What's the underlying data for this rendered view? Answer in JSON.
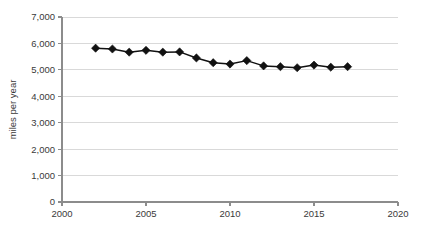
{
  "chart_data": {
    "type": "line",
    "title": "",
    "subtitle": "",
    "xlabel": "",
    "ylabel": "miles per year",
    "xlim": [
      2000,
      2020
    ],
    "ylim": [
      0,
      7000
    ],
    "grid": true,
    "legend": "none",
    "marker": "diamond",
    "marker_color": "#111111",
    "line_color": "#111111",
    "grid_color": "#d9d9d9",
    "axis_color": "#8c8c8c",
    "x_tick_labels": [
      "2000",
      "2005",
      "2010",
      "2015",
      "2020"
    ],
    "x_ticks": [
      2000,
      2005,
      2010,
      2015,
      2020
    ],
    "y_tick_labels": [
      "0",
      "1,000",
      "2,000",
      "3,000",
      "4,000",
      "5,000",
      "6,000",
      "7,000"
    ],
    "y_ticks": [
      0,
      1000,
      2000,
      3000,
      4000,
      5000,
      6000,
      7000
    ],
    "x": [
      2002,
      2003,
      2004,
      2005,
      2006,
      2007,
      2008,
      2009,
      2010,
      2011,
      2012,
      2013,
      2014,
      2015,
      2016,
      2017
    ],
    "values": [
      5820,
      5790,
      5670,
      5740,
      5670,
      5680,
      5450,
      5270,
      5220,
      5350,
      5150,
      5120,
      5080,
      5180,
      5100,
      5120
    ],
    "series": [
      {
        "name": "miles per year",
        "values": [
          5820,
          5790,
          5670,
          5740,
          5670,
          5680,
          5450,
          5270,
          5220,
          5350,
          5150,
          5120,
          5080,
          5180,
          5100,
          5120
        ]
      }
    ]
  }
}
